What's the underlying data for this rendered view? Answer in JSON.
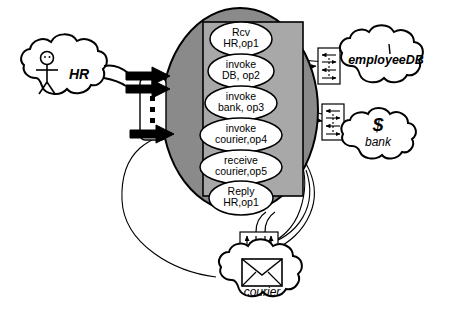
{
  "diagram": {
    "colors": {
      "process_ellipse_fill": "#8a8a8a",
      "inner_rect_fill": "#a8a8a8",
      "activity_fill": "#ffffff",
      "stroke": "#000000",
      "cloud_fill": "#ffffff",
      "port_fill": "#ffffff"
    }
  },
  "process": {
    "name": "orchestration-process",
    "activities": [
      {
        "id": "a1",
        "line1": "Rcv",
        "line2": "HR,op1"
      },
      {
        "id": "a2",
        "line1": "invoke",
        "line2": "DB, op2"
      },
      {
        "id": "a3",
        "line1": "invoke",
        "line2": "bank, op3"
      },
      {
        "id": "a4",
        "line1": "invoke",
        "line2": "courier,op4"
      },
      {
        "id": "a5",
        "line1": "receive",
        "line2": "courier,op5"
      },
      {
        "id": "a6",
        "line1": "Reply",
        "line2": "HR,op1"
      }
    ]
  },
  "partners": {
    "hr": {
      "label": "HR",
      "icon": "stick-figure-icon",
      "glyph": ""
    },
    "employeedb": {
      "label": "employeeDB",
      "icon": "database-icon",
      "glyph": ""
    },
    "bank": {
      "label": "bank",
      "icon": "dollar-icon",
      "glyph": "$"
    },
    "courier": {
      "label": "courier",
      "icon": "envelope-icon",
      "glyph": ""
    }
  },
  "ports": {
    "client_port": {
      "name": "client-port",
      "ellipsis": "▪"
    },
    "db_port": {
      "name": "employeedb-port"
    },
    "bank_port": {
      "name": "bank-port"
    },
    "courier_port": {
      "name": "courier-port"
    }
  }
}
